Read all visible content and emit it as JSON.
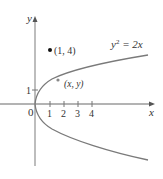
{
  "diagram": {
    "axes": {
      "x_label": "x",
      "y_label": "y",
      "origin_label": "0",
      "x_ticks": [
        "1",
        "2",
        "3",
        "4"
      ],
      "y_ticks": [
        "1"
      ]
    },
    "curve": {
      "equation_lhs": "y",
      "equation_exp": "2",
      "equation_rhs": " = 2x",
      "color": "#7a7a7a"
    },
    "points": [
      {
        "label": "(1, 4)",
        "x": 1,
        "y": 4
      },
      {
        "label": "(x, y)",
        "x": 1.6,
        "y": 1.8
      }
    ],
    "colors": {
      "axis": "#9a9a9a",
      "text": "#333333",
      "point": "#111111"
    }
  }
}
